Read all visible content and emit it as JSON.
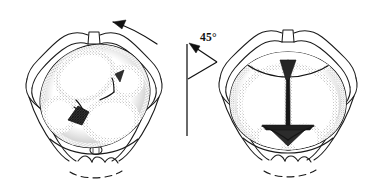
{
  "figure": {
    "background_color": "#ffffff",
    "ink_color": "#1a1a1a",
    "width": 390,
    "height": 186
  },
  "annotation": {
    "angle_label": "45°",
    "angle_value": 45,
    "angle_unit": "degrees",
    "rotation_direction": "counter-clockwise"
  },
  "panels": [
    {
      "id": "left-panel",
      "name": "oblique-presentation",
      "description": "Pelvic inlet with fetal head in oblique position, posterior fontanelle at lower left",
      "head_orientation": "oblique",
      "fontanelle_shape": "diamond",
      "fontanelle_fill": "#2a2a2a",
      "motion_arrow": "curved-arrow-counter-clockwise"
    },
    {
      "id": "right-panel",
      "name": "direct-occiput-anterior",
      "description": "Pelvic inlet with fetal head rotated, sagittal suture vertical, fontanelle at lower midline",
      "head_orientation": "vertical-sagittal",
      "fontanelle_shape": "triangular",
      "fontanelle_fill": "#2a2a2a",
      "motion_arrow": "none"
    }
  ],
  "anatomy": {
    "structures": [
      "pubic-symphysis",
      "superior-pubic-ramus",
      "iliac-crest",
      "ischial-spine",
      "sacrum",
      "coccyx",
      "fetal-skull",
      "sagittal-suture",
      "coronal-suture",
      "lambdoid-suture",
      "posterior-fontanelle",
      "anterior-fontanelle"
    ]
  }
}
